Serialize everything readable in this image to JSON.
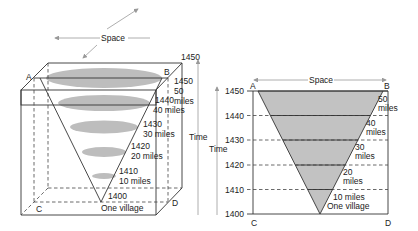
{
  "colors": {
    "ellipse_fill": "#bdbdbd",
    "cone_fill": "#c2c2c2",
    "line": "#333333",
    "arrow": "#999999"
  },
  "left_diagram": {
    "space_label": "Space",
    "time_label": "Time",
    "corners": {
      "A": "A",
      "B": "B",
      "C": "C",
      "D": "D"
    },
    "top_year": "1450",
    "levels": [
      {
        "year": "1450",
        "radius_label": "50",
        "radius_unit": "miles"
      },
      {
        "year": "1440",
        "radius_label": "40 miles"
      },
      {
        "year": "1430",
        "radius_label": "30 miles"
      },
      {
        "year": "1420",
        "radius_label": "20 miles"
      },
      {
        "year": "1410",
        "radius_label": "10 miles"
      },
      {
        "year": "1400",
        "radius_label": "One village"
      }
    ]
  },
  "right_diagram": {
    "space_label": "Space",
    "time_label": "Time",
    "corners": {
      "A": "A",
      "B": "B",
      "C": "C",
      "D": "D"
    },
    "time_ticks": [
      "1450",
      "1440",
      "1430",
      "1420",
      "1410",
      "1400"
    ],
    "band_labels": [
      {
        "line1": "50",
        "line2": "miles"
      },
      {
        "line1": "40",
        "line2": "miles"
      },
      {
        "line1": "30",
        "line2": "miles"
      },
      {
        "line1": "20",
        "line2": "miles"
      },
      {
        "line1": "10 miles",
        "line2": "One village"
      }
    ]
  }
}
